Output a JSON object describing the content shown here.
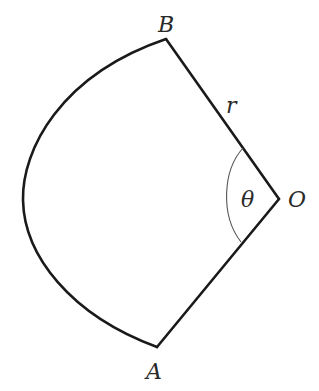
{
  "figure": {
    "type": "circular sector diagram",
    "labels": {
      "vertex_top": "B",
      "vertex_bottom": "A",
      "center": "O",
      "radius": "r",
      "angle": "θ"
    },
    "points": {
      "O": [
        279,
        199
      ],
      "B": [
        166,
        39
      ],
      "A": [
        157,
        347
      ]
    },
    "colors": {
      "stroke": "#1a1a1a",
      "angle_arc": "#555555",
      "text": "#2a2a2a",
      "background": "#ffffff"
    }
  }
}
